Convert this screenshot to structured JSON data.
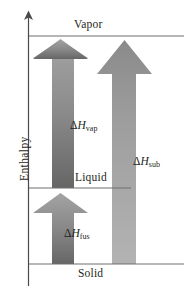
{
  "figure": {
    "kind": "enthalpy-phase-change-diagram",
    "width": 184,
    "height": 291,
    "background": "#ffffff",
    "line_color": "#6e6e6e",
    "text_color": "#231f20"
  },
  "axis": {
    "title": "Enthalpy",
    "orientation": "vertical",
    "arrow_at_top": true
  },
  "phase_levels": [
    {
      "id": "vapor",
      "label": "Vapor",
      "y": 36
    },
    {
      "id": "liquid",
      "label": "Liquid",
      "y": 188
    },
    {
      "id": "solid",
      "label": "Solid",
      "y": 264
    }
  ],
  "arrows": [
    {
      "id": "vaporization",
      "delta": "Δ",
      "symbol": "H",
      "subscript": "vap",
      "label": "ΔHvap",
      "from_level": "liquid",
      "to_level": "vapor",
      "color_top": "#9b9b9b",
      "color_bottom": "#6d6d6d"
    },
    {
      "id": "sublimation",
      "delta": "Δ",
      "symbol": "H",
      "subscript": "sub",
      "label": "ΔHsub",
      "from_level": "solid",
      "to_level": "vapor",
      "color_top": "#8e8e8e",
      "color_bottom": "#aeaeae"
    },
    {
      "id": "fusion",
      "delta": "Δ",
      "symbol": "H",
      "subscript": "fus",
      "label": "ΔHfus",
      "from_level": "solid",
      "to_level": "liquid",
      "color_top": "#9b9b9b",
      "color_bottom": "#6d6d6d"
    }
  ]
}
